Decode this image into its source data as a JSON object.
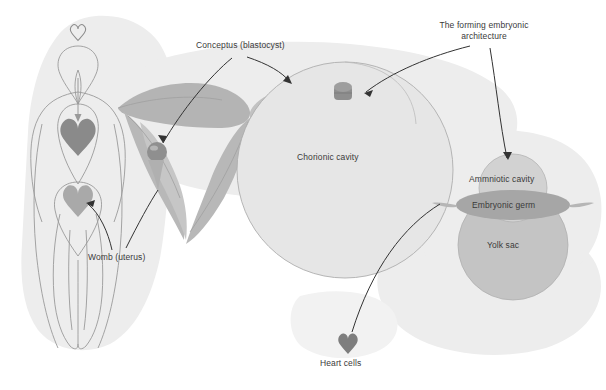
{
  "figure": {
    "type": "biological-diagram"
  },
  "labels": {
    "conceptus": "Conceptus (blastocyst)",
    "forming_architecture": "The forming embryonic architecture",
    "forming_architecture_line1": "The forming embryonic",
    "forming_architecture_line2": "architecture",
    "chorionic_cavity": "Chorionic cavity",
    "amniotic_cavity": "Ammniotic cavity",
    "embryonic_germ": "Embryonic germ",
    "yolk_sac": "Yolk sac",
    "womb": "Womb (uterus)",
    "heart_cells": "Heart cells"
  },
  "icons": {
    "heart_head": "heart-icon",
    "heart_chest": "heart-icon",
    "heart_pelvis": "heart-icon",
    "heart_cells": "heart-icon",
    "blastocyst": "blastocyst-sphere-icon",
    "embryo_disc": "embryonic-disc-icon"
  },
  "colors": {
    "background": "#ffffff",
    "blob_fill": "#ededed",
    "organ_fill": "#b9b9b9",
    "organ_fill_light": "#c9c9c9",
    "heart_dark": "#808080",
    "heart_mid": "#9a9a9a",
    "heart_light": "#b0b0b0",
    "cavity_fill": "#e2e2e2",
    "cavity_stroke": "#b0b0b0",
    "germ_fill": "#a8a8a8",
    "yolk_fill": "#c6c6c6",
    "outline": "#8c8c8c",
    "leader_line": "#3a3a3a",
    "text": "#3a3a3a"
  }
}
